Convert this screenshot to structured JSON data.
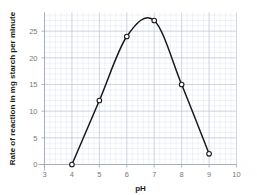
{
  "chart_data": {
    "type": "line",
    "title": "",
    "subtitle": "",
    "xlabel": "pH",
    "ylabel": "Rate of reaction in mg starch per minute",
    "x": [
      4,
      5,
      6,
      7,
      8,
      9
    ],
    "values": [
      0,
      12,
      24,
      27,
      15,
      2
    ],
    "series": [
      {
        "name": "Rate of reaction",
        "x": [
          4,
          5,
          6,
          7,
          8,
          9
        ],
        "values": [
          0,
          12,
          24,
          27,
          15,
          2
        ]
      }
    ],
    "peak": {
      "x": 6.7,
      "y": 27.5
    },
    "xlim": [
      3,
      10
    ],
    "ylim": [
      0,
      28.5
    ],
    "xticks": [
      3,
      4,
      5,
      6,
      7,
      8,
      9,
      10
    ],
    "yticks": [
      0,
      5,
      10,
      15,
      20,
      25
    ],
    "xtick_labels": [
      "3",
      "4",
      "5",
      "6",
      "7",
      "8",
      "9",
      "10"
    ],
    "ytick_labels": [
      "0",
      "5",
      "10",
      "15",
      "20",
      "25"
    ],
    "x_minor_step": 0.2,
    "y_minor_step": 1,
    "grid": true,
    "grid_minor": true,
    "legend": false,
    "legend_position": "none",
    "markers": "open-circle",
    "annotations": []
  },
  "style": {
    "background": "#ffffff",
    "curve_color": "#1a1a1a",
    "marker_fill": "#ffffff",
    "marker_stroke": "#1a1a1a",
    "grid_minor_color": "#dfe5ef",
    "grid_major_color": "#c2ccdb",
    "axis_color": "#9aa3ae",
    "tick_label_color": "#7a7a7a",
    "axis_title_color": "#1c1c1c"
  }
}
